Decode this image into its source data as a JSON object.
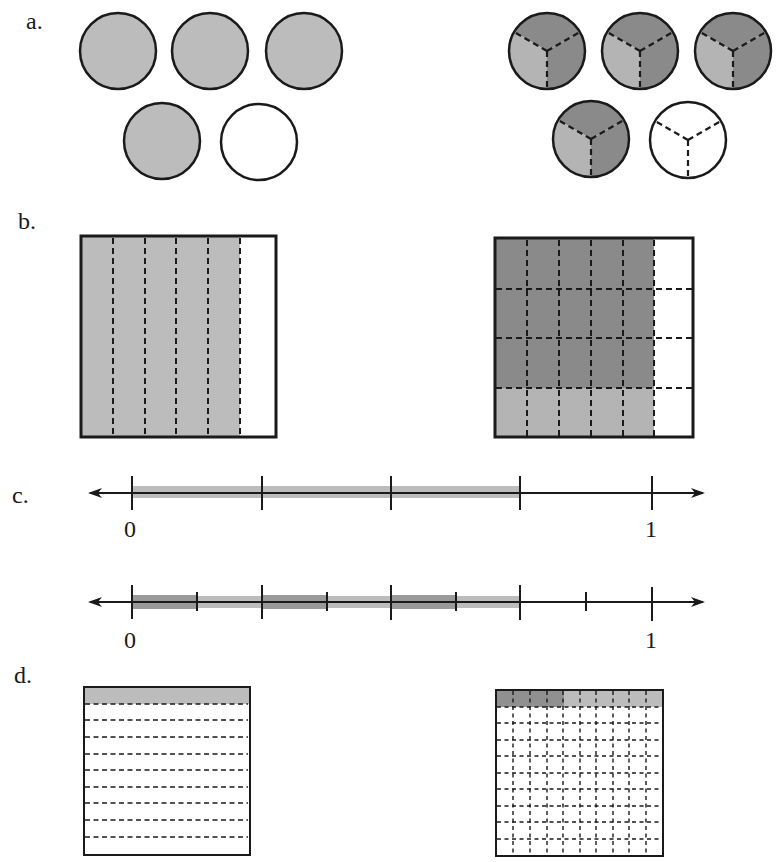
{
  "parts": {
    "a": {
      "label": "a.",
      "left": {
        "description": "4 of 5 whole circles shaded",
        "circles_total": 5,
        "circles_shaded": 4
      },
      "right": {
        "description": "5 circles each divided into 3 parts; 2/3 dark, 1/3 light shading in first 4; last unshaded",
        "circles_total": 5,
        "parts_per_circle": 3
      }
    },
    "b": {
      "label": "b.",
      "left": {
        "description": "Square divided into 6 vertical strips, 5 shaded",
        "columns": 6,
        "shaded_columns": 5
      },
      "right": {
        "description": "Square divided into 6 columns x 4 rows; 5 columns shaded, top 3 rows darker",
        "columns": 6,
        "rows": 4,
        "shaded_columns": 5,
        "dark_rows": 3
      }
    },
    "c": {
      "label": "c.",
      "line1": {
        "start_label": "0",
        "end_label": "1",
        "divisions": 4,
        "shaded_to": 3
      },
      "line2": {
        "start_label": "0",
        "end_label": "1",
        "divisions": 8,
        "shaded_to": 6
      }
    },
    "d": {
      "label": "d.",
      "left": {
        "description": "Square divided into 10 horizontal rows, top row shaded",
        "rows": 10,
        "shaded_rows": 1
      },
      "right": {
        "description": "10x10 grid, top row shaded: first 4 darker, remaining 6 lighter",
        "rows": 10,
        "columns": 10,
        "dark_cells": 4,
        "light_cells": 6
      }
    }
  },
  "colors": {
    "light_gray": "#bcbcbc",
    "mid_gray": "#a9a9a9",
    "dark_gray": "#8a8a8a",
    "stroke": "#1a1a1a"
  }
}
